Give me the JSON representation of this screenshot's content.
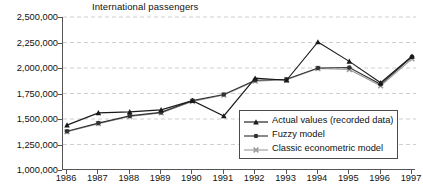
{
  "chart_data": {
    "type": "line",
    "title": "International passengers",
    "xlabel": "",
    "ylabel": "",
    "x": [
      1986,
      1987,
      1988,
      1989,
      1990,
      1991,
      1992,
      1993,
      1994,
      1995,
      1996,
      1997
    ],
    "categories": [
      "1986",
      "1987",
      "1988",
      "1989",
      "1990",
      "1991",
      "1992",
      "1993",
      "1994",
      "1995",
      "1996",
      "1997"
    ],
    "ylim": [
      1000000,
      2500000
    ],
    "ytick_values": [
      1000000,
      1250000,
      1500000,
      1750000,
      2000000,
      2250000,
      2500000
    ],
    "ytick_labels": [
      "1,000,000",
      "1,250,000",
      "1,500,000",
      "1,750,000",
      "2,000,000",
      "2,250,000",
      "2,500,000"
    ],
    "grid": true,
    "grid_style": "dashed-horizontal",
    "legend_position": "bottom-right",
    "series": [
      {
        "name": "Actual values (recorded data)",
        "marker": "triangle",
        "color": "#1a1a1a",
        "values": [
          1440000,
          1560000,
          1570000,
          1590000,
          1680000,
          1530000,
          1900000,
          1880000,
          2255000,
          2065000,
          1855000,
          2115000
        ]
      },
      {
        "name": "Fuzzy model",
        "marker": "circle",
        "color": "#333333",
        "values": [
          1380000,
          1460000,
          1530000,
          1565000,
          1680000,
          1740000,
          1880000,
          1890000,
          2000000,
          2005000,
          1840000,
          2110000
        ]
      },
      {
        "name": "Classic econometric model",
        "marker": "cross",
        "color": "#9a9a9a",
        "values": [
          1375000,
          1455000,
          1525000,
          1560000,
          1672000,
          1735000,
          1872000,
          1885000,
          1995000,
          1985000,
          1825000,
          2090000
        ]
      }
    ]
  },
  "legend": {
    "entries": [
      "Actual values (recorded data)",
      "Fuzzy model",
      "Classic econometric model"
    ]
  }
}
